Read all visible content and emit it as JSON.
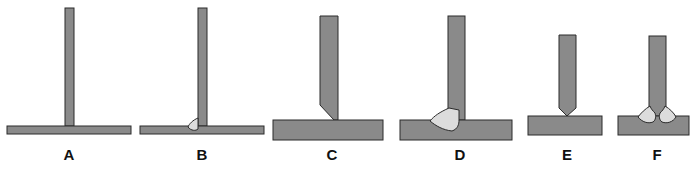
{
  "diagram": {
    "type": "t-joint weld preparation sequence",
    "figures": [
      {
        "id": "A",
        "label": "A",
        "description": "Thin vertical plate standing on thin base plate, no weld"
      },
      {
        "id": "B",
        "label": "B",
        "description": "Thin T-joint with small single-side fillet weld bead"
      },
      {
        "id": "C",
        "label": "C",
        "description": "Thick vertical plate with single bevel on left, resting on thick base plate"
      },
      {
        "id": "D",
        "label": "D",
        "description": "Single-bevel T-joint filled with weld on left side"
      },
      {
        "id": "E",
        "label": "E",
        "description": "Vertical plate with double bevel (pointed end) resting on base plate"
      },
      {
        "id": "F",
        "label": "F",
        "description": "Double-bevel T-joint with weld beads on both sides"
      }
    ]
  },
  "colors": {
    "metal": "#8a8a8a",
    "weld": "#dcdcdc",
    "outline": "#2a2a2a"
  }
}
